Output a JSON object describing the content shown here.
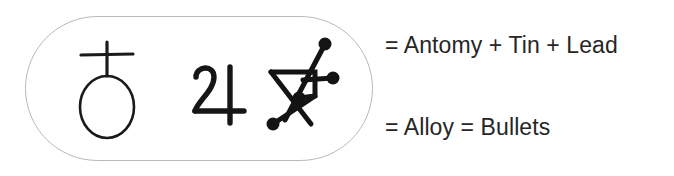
{
  "figure": {
    "background_color": "#ffffff",
    "border_color": "#b9b9b9",
    "ink_color": "#1a1a1a",
    "text_color": "#262626"
  },
  "group": {
    "label": "symbol-group",
    "symbols": [
      {
        "id": "antimony",
        "name": "Antimony",
        "glyph_description": "circle surmounted by a cross",
        "unicode": "♁"
      },
      {
        "id": "tin",
        "name": "Tin (Jupiter)",
        "glyph_description": "Jupiter sign resembling the numeral 24",
        "unicode": "♃"
      },
      {
        "id": "lead",
        "name": "Lead",
        "glyph_description": "zigzag Z stroke crossed by a diagonal with round terminals",
        "unicode": "♄"
      }
    ]
  },
  "annotations": {
    "line1": "= Antomy + Tin + Lead",
    "line2": "= Alloy = Bullets"
  }
}
